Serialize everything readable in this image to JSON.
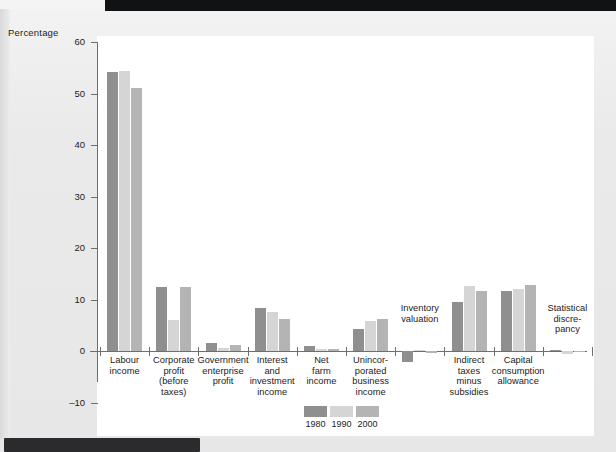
{
  "page": {
    "ylabel": "Percentage"
  },
  "chart_data": {
    "type": "bar",
    "title": "",
    "xlabel": "",
    "ylabel": "Percentage",
    "ylim": [
      -10,
      60
    ],
    "yticks": [
      60,
      50,
      40,
      30,
      20,
      10,
      0,
      -10
    ],
    "ytick_labels": [
      "60",
      "50",
      "40",
      "30",
      "20",
      "10",
      "0",
      "–10"
    ],
    "grid": false,
    "legend_position": "bottom",
    "categories": [
      "Labour income",
      "Corporate profit (before taxes)",
      "Government enterprise profit",
      "Interest and investment income",
      "Net farm income",
      "Unincorporated business income",
      "Inventory valuation",
      "Indirect taxes minus subsidies",
      "Capital consumption allowance",
      "Statistical discrepancy"
    ],
    "category_lines": [
      [
        "Labour",
        "income"
      ],
      [
        "Corporate",
        "profit",
        "(before",
        "taxes)"
      ],
      [
        "Government",
        "enterprise",
        "profit"
      ],
      [
        "Interest",
        "and",
        "investment",
        "income"
      ],
      [
        "Net",
        "farm",
        "income"
      ],
      [
        "Unincor-",
        "porated",
        "business",
        "income"
      ],
      [
        "Inventory",
        "valuation"
      ],
      [
        "Indirect",
        "taxes",
        "minus",
        "subsidies"
      ],
      [
        "Capital",
        "consumption",
        "allowance"
      ],
      [
        "Statistical",
        "discre-",
        "pancy"
      ]
    ],
    "series": [
      {
        "name": "1980",
        "color": "#8f8f8f",
        "values": [
          54.2,
          12.5,
          1.6,
          8.3,
          0.9,
          4.3,
          -2.1,
          9.6,
          11.7,
          0.1
        ]
      },
      {
        "name": "1990",
        "color": "#d5d5d5",
        "values": [
          54.3,
          6.1,
          0.6,
          7.6,
          0.4,
          5.8,
          0.2,
          12.7,
          12.0,
          -0.5
        ]
      },
      {
        "name": "2000",
        "color": "#b4b4b4",
        "values": [
          51.0,
          12.4,
          1.1,
          6.3,
          0.3,
          6.2,
          -0.3,
          11.7,
          12.8,
          -0.2
        ]
      }
    ],
    "legend": [
      "1980",
      "1990",
      "2000"
    ]
  }
}
